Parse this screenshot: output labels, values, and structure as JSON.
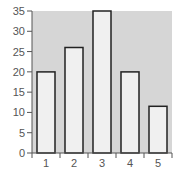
{
  "chart_data": {
    "type": "bar",
    "title": "",
    "xlabel": "",
    "ylabel": "",
    "categories": [
      "1",
      "2",
      "3",
      "4",
      "5"
    ],
    "values": [
      20,
      26,
      35,
      20,
      11.5
    ],
    "ylim": [
      0,
      35
    ],
    "yticks": [
      0,
      5,
      10,
      15,
      20,
      25,
      30,
      35
    ],
    "grid": false,
    "legend": null,
    "colors": {
      "plot_background": "#d6d6d6",
      "bar_fill": "#f0f0f0",
      "bar_stroke": "#222222",
      "axis": "#555555",
      "tick_label": "#555555"
    }
  }
}
